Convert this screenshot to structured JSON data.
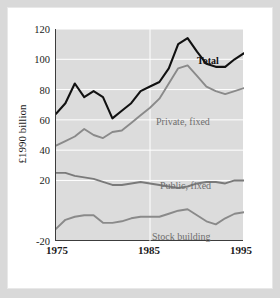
{
  "chart_data": {
    "type": "line",
    "title": "",
    "xlabel": "",
    "ylabel": "£1990 billion",
    "xlim": [
      1975,
      1995
    ],
    "ylim": [
      -20,
      120
    ],
    "yticks": [
      -20,
      20,
      40,
      60,
      80,
      100,
      120
    ],
    "xticks": [
      1975,
      1985,
      1995
    ],
    "grid": "white horizontal gridlines and vertical gridlines at 1985 and 1995",
    "legend_position": "inline labels beside each series",
    "x": [
      1975,
      1976,
      1977,
      1978,
      1979,
      1980,
      1981,
      1982,
      1983,
      1984,
      1985,
      1986,
      1987,
      1988,
      1989,
      1990,
      1991,
      1992,
      1993,
      1994,
      1995
    ],
    "series": [
      {
        "name": "Total",
        "color": "#111111",
        "values": [
          64,
          71,
          84,
          75,
          79,
          75,
          61,
          66,
          71,
          79,
          82,
          85,
          94,
          110,
          114,
          105,
          97,
          95,
          95,
          100,
          104
        ]
      },
      {
        "name": "Private, fixed",
        "color": "#8a8a8a",
        "values": [
          43,
          46,
          49,
          54,
          50,
          48,
          52,
          53,
          58,
          63,
          68,
          74,
          84,
          94,
          96,
          89,
          82,
          79,
          77,
          79,
          81
        ]
      },
      {
        "name": "Public, fixed",
        "color": "#7a7a7a",
        "values": [
          25,
          25,
          23,
          22,
          21,
          19,
          17,
          17,
          18,
          19,
          18,
          17,
          16,
          15,
          16,
          18,
          19,
          19,
          18,
          20,
          20
        ]
      },
      {
        "name": "Stock building",
        "color": "#8a8a8a",
        "values": [
          -12,
          -6,
          -4,
          -3,
          -3,
          -8,
          -8,
          -7,
          -5,
          -4,
          -4,
          -4,
          -2,
          0,
          1,
          -3,
          -7,
          -9,
          -5,
          -2,
          -1
        ]
      }
    ]
  },
  "axis": {
    "y_label": "£1990 billion",
    "y_ticks": [
      "120",
      "100",
      "80",
      "60",
      "40",
      "20",
      "-20"
    ],
    "x_ticks": [
      "1975",
      "1985",
      "1995"
    ]
  },
  "labels": {
    "total": "Total",
    "private_fixed": "Private, fixed",
    "public_fixed": "Public, fixed",
    "stock_building": "Stock building"
  },
  "colors": {
    "plot_background": "#dcdcdc",
    "gridline": "#ffffff",
    "axis": "#3c3c3c",
    "total_line": "#111111",
    "gray_line": "#8a8a8a",
    "page_background": "#d9d9d9",
    "card_background": "#ffffff"
  }
}
